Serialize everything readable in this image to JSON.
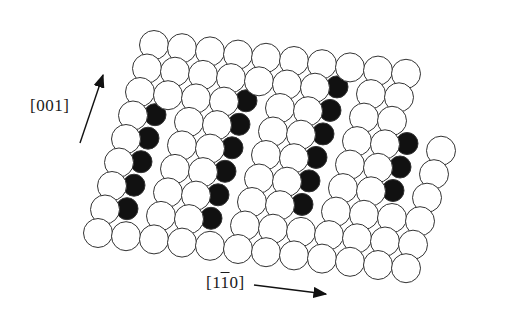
{
  "figure": {
    "type": "atomic surface structure (ball model)",
    "background": "#ffffff",
    "atom_colors": {
      "white": "#ffffff",
      "black": "#111111",
      "outline": "#333333"
    }
  },
  "labels": {
    "dir_001": "[001]",
    "dir_1m10_prefix": "[1",
    "dir_1m10_bar": "1",
    "dir_1m10_suffix": "0]"
  },
  "arrows": [
    {
      "name": "arrow-001",
      "x1": 80,
      "y1": 143,
      "x2": 103,
      "y2": 75
    },
    {
      "name": "arrow-1m10",
      "x1": 254,
      "y1": 285,
      "x2": 326,
      "y2": 294
    }
  ],
  "lattice": {
    "radius": 14.5,
    "origin": [
      98,
      233
    ],
    "a": [
      28,
      3.2
    ],
    "b": [
      7,
      -23.5
    ],
    "rows": 9,
    "cols": 12,
    "black_sites": [
      [
        1,
        1
      ],
      [
        1,
        2
      ],
      [
        1,
        3
      ],
      [
        1,
        4
      ],
      [
        1,
        5
      ],
      [
        4,
        1
      ],
      [
        4,
        2
      ],
      [
        4,
        3
      ],
      [
        4,
        4
      ],
      [
        4,
        5
      ],
      [
        4,
        6
      ],
      [
        7,
        2
      ],
      [
        7,
        3
      ],
      [
        7,
        4
      ],
      [
        7,
        5
      ],
      [
        7,
        6
      ],
      [
        7,
        7
      ],
      [
        10,
        3
      ],
      [
        10,
        4
      ],
      [
        10,
        5
      ],
      [
        10,
        6
      ],
      [
        10,
        7
      ],
      [
        10,
        8
      ]
    ],
    "raised": [
      [
        2,
        4
      ],
      [
        5,
        5
      ],
      [
        8,
        5
      ]
    ]
  }
}
